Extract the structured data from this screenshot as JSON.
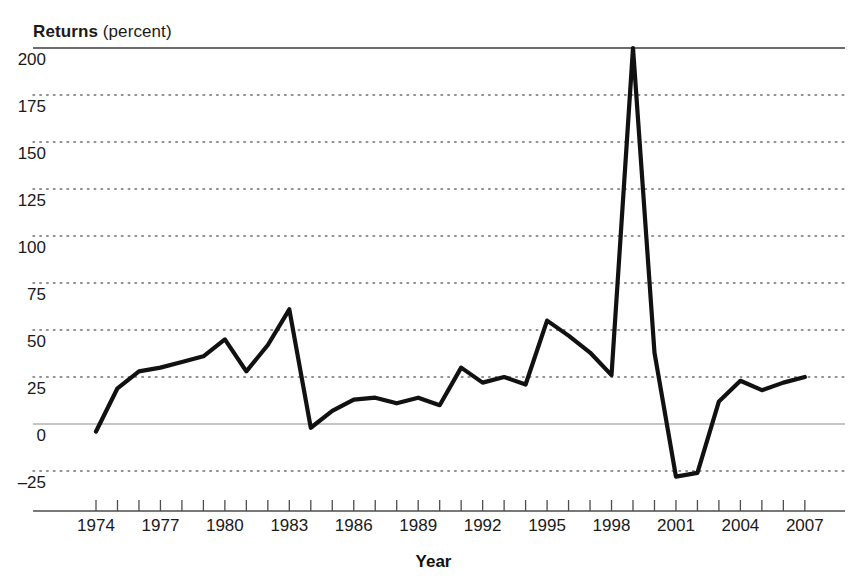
{
  "figure": {
    "title_bold": "Returns",
    "title_rest": " (percent)",
    "xlabel": "Year"
  },
  "axes": {
    "y_ticks": [
      200,
      175,
      150,
      125,
      100,
      75,
      50,
      25,
      0,
      -25
    ],
    "y_tick_labels": [
      "200",
      "175",
      "150",
      "125",
      "100",
      "75",
      "50",
      "25",
      "0",
      "–25"
    ],
    "x_tick_labels": [
      "1974",
      "1977",
      "1980",
      "1983",
      "1986",
      "1989",
      "1992",
      "1995",
      "1998",
      "2001",
      "2004",
      "2007"
    ],
    "x_minor_years": [
      1974,
      1975,
      1976,
      1977,
      1978,
      1979,
      1980,
      1981,
      1982,
      1983,
      1984,
      1985,
      1986,
      1987,
      1988,
      1989,
      1990,
      1991,
      1992,
      1993,
      1994,
      1995,
      1996,
      1997,
      1998,
      1999,
      2000,
      2001,
      2002,
      2003,
      2004,
      2005,
      2006,
      2007
    ]
  },
  "colors": {
    "line": "#111111",
    "zero_line": "#8c8c8c",
    "grid_dot": "#6e6e6e",
    "top_rule": "#3d3d3d",
    "axis": "#4d4d4d",
    "background": "#ffffff"
  },
  "chart_data": {
    "type": "line",
    "title": "Returns (percent)",
    "xlabel": "Year",
    "ylabel": "Returns (percent)",
    "xlim": [
      1973.5,
      2008
    ],
    "ylim": [
      -37,
      200
    ],
    "grid": "horizontal-dotted",
    "legend": "none",
    "x": [
      1974,
      1975,
      1976,
      1977,
      1978,
      1979,
      1980,
      1981,
      1982,
      1983,
      1984,
      1985,
      1986,
      1987,
      1988,
      1989,
      1990,
      1991,
      1992,
      1993,
      1994,
      1995,
      1996,
      1997,
      1998,
      1999,
      2000,
      2001,
      2002,
      2003,
      2004,
      2005,
      2006,
      2007
    ],
    "values": [
      -4,
      19,
      28,
      30,
      33,
      36,
      45,
      28,
      42,
      61,
      -2,
      7,
      13,
      14,
      11,
      14,
      10,
      30,
      22,
      25,
      21,
      55,
      47,
      38,
      26,
      200,
      38,
      -28,
      -26,
      12,
      23,
      18,
      22,
      25
    ],
    "series": [
      {
        "name": "Returns",
        "values": [
          -4,
          19,
          28,
          30,
          33,
          36,
          45,
          28,
          42,
          61,
          -2,
          7,
          13,
          14,
          11,
          14,
          10,
          30,
          22,
          25,
          21,
          55,
          47,
          38,
          26,
          200,
          38,
          -28,
          -26,
          12,
          23,
          18,
          22,
          25
        ]
      }
    ],
    "annotations": [
      {
        "label": "peak",
        "x": 1999,
        "y": 200
      }
    ]
  }
}
